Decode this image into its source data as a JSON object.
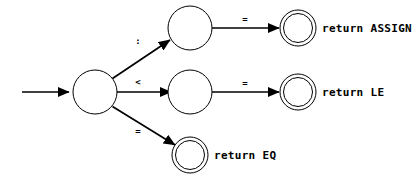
{
  "diagram": {
    "type": "finite-state-machine",
    "title": "",
    "colors": {
      "stroke": "#000000",
      "background": "#ffffff",
      "text": "#000000"
    },
    "start_arrow": {
      "name": "start-transition",
      "label": ""
    },
    "states": [
      {
        "id": "start",
        "kind": "normal",
        "label": "",
        "cx": 95,
        "cy": 92,
        "r": 22
      },
      {
        "id": "assign-mid",
        "kind": "normal",
        "label": "",
        "cx": 190,
        "cy": 28,
        "r": 22
      },
      {
        "id": "le-mid",
        "kind": "normal",
        "label": "",
        "cx": 190,
        "cy": 92,
        "r": 22
      },
      {
        "id": "assign-accept",
        "kind": "accepting",
        "label": "",
        "cx": 298,
        "cy": 28,
        "r": 18
      },
      {
        "id": "le-accept",
        "kind": "accepting",
        "label": "",
        "cx": 298,
        "cy": 92,
        "r": 18
      },
      {
        "id": "eq-accept",
        "kind": "accepting",
        "label": "",
        "cx": 190,
        "cy": 155,
        "r": 18
      }
    ],
    "transitions": [
      {
        "id": "t-colon",
        "from": "start",
        "to": "assign-mid",
        "label": ":",
        "label_x": 138,
        "label_y": 44
      },
      {
        "id": "t-lt",
        "from": "start",
        "to": "le-mid",
        "label": "<",
        "label_x": 138,
        "label_y": 85
      },
      {
        "id": "t-eq-start",
        "from": "start",
        "to": "eq-accept",
        "label": "=",
        "label_x": 138,
        "label_y": 134
      },
      {
        "id": "t-eq-assign",
        "from": "assign-mid",
        "to": "assign-accept",
        "label": "=",
        "label_x": 245,
        "label_y": 22
      },
      {
        "id": "t-eq-le",
        "from": "le-mid",
        "to": "le-accept",
        "label": "=",
        "label_x": 245,
        "label_y": 86
      }
    ],
    "annotations": [
      {
        "id": "ann-assign",
        "text": "return ASSIGN",
        "x": 322,
        "y": 29
      },
      {
        "id": "ann-le",
        "text": "return LE",
        "x": 322,
        "y": 93
      },
      {
        "id": "ann-eq",
        "text": "return EQ",
        "x": 214,
        "y": 156
      }
    ]
  }
}
